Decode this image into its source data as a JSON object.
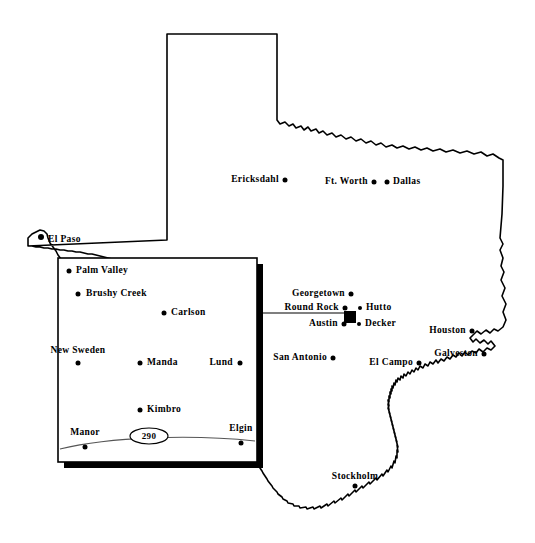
{
  "map": {
    "title": "Texas Swedish Settlements Map",
    "region": "Texas",
    "background_color": "#ffffff",
    "ink_color": "#000000",
    "state_outline_name": "texas-state-outline"
  },
  "cities": [
    {
      "name": "El Paso",
      "x": 41,
      "y": 237,
      "label_x": 48,
      "label_y": 240,
      "anchor": "right",
      "marker": "dot",
      "marker_size": 6
    },
    {
      "name": "Ericksdahl",
      "x": 285,
      "y": 180,
      "label_x": 279,
      "label_y": 180,
      "anchor": "left",
      "marker": "dot",
      "marker_size": 5
    },
    {
      "name": "Ft. Worth",
      "x": 374,
      "y": 182,
      "label_x": 368,
      "label_y": 182,
      "anchor": "left",
      "marker": "dot",
      "marker_size": 5
    },
    {
      "name": "Dallas",
      "x": 387,
      "y": 182,
      "label_x": 393,
      "label_y": 182,
      "anchor": "right",
      "marker": "dot",
      "marker_size": 5
    },
    {
      "name": "Georgetown",
      "x": 351,
      "y": 294,
      "label_x": 345,
      "label_y": 294,
      "anchor": "left",
      "marker": "dot",
      "marker_size": 5
    },
    {
      "name": "Round Rock",
      "x": 345,
      "y": 308,
      "label_x": 339,
      "label_y": 308,
      "anchor": "left",
      "marker": "dot",
      "marker_size": 5
    },
    {
      "name": "Hutto",
      "x": 360,
      "y": 308,
      "label_x": 366,
      "label_y": 308,
      "anchor": "right",
      "marker": "dot",
      "marker_size": 4
    },
    {
      "name": "Austin",
      "x": 344,
      "y": 324,
      "label_x": 338,
      "label_y": 324,
      "anchor": "left",
      "marker": "dot",
      "marker_size": 5
    },
    {
      "name": "Decker",
      "x": 359,
      "y": 324,
      "label_x": 365,
      "label_y": 324,
      "anchor": "right",
      "marker": "dot",
      "marker_size": 4
    },
    {
      "name": "San Antonio",
      "x": 333,
      "y": 358,
      "label_x": 327,
      "label_y": 358,
      "anchor": "left",
      "marker": "dot",
      "marker_size": 5
    },
    {
      "name": "Houston",
      "x": 472,
      "y": 331,
      "label_x": 466,
      "label_y": 331,
      "anchor": "left",
      "marker": "dot",
      "marker_size": 5
    },
    {
      "name": "Galveston",
      "x": 484,
      "y": 354,
      "label_x": 478,
      "label_y": 354,
      "anchor": "left",
      "marker": "dot",
      "marker_size": 5
    },
    {
      "name": "El Campo",
      "x": 419,
      "y": 363,
      "label_x": 413,
      "label_y": 363,
      "anchor": "left",
      "marker": "dot",
      "marker_size": 5
    },
    {
      "name": "Stockholm",
      "x": 355,
      "y": 486,
      "label_x": 355,
      "label_y": 481,
      "anchor": "above",
      "marker": "dot",
      "marker_size": 5
    }
  ],
  "metro_marker": {
    "name": "Austin metro area inset marker",
    "x": 350,
    "y": 317,
    "width": 12,
    "height": 12
  },
  "inset": {
    "name": "Austin area detail inset",
    "left": 58,
    "top": 258,
    "width": 199,
    "height": 204,
    "border_width": 2,
    "shadow_width": 6,
    "connector": {
      "from_x": 257,
      "from_y": 313,
      "to_x": 344,
      "to_y": 313
    },
    "cities": [
      {
        "name": "Palm Valley",
        "x": 69,
        "y": 271,
        "label_x": 76,
        "label_y": 271,
        "anchor": "right",
        "marker_size": 5
      },
      {
        "name": "Brushy Creek",
        "x": 78,
        "y": 294,
        "label_x": 86,
        "label_y": 294,
        "anchor": "right",
        "marker_size": 5
      },
      {
        "name": "Carlson",
        "x": 164,
        "y": 313,
        "label_x": 171,
        "label_y": 313,
        "anchor": "right",
        "marker_size": 5
      },
      {
        "name": "New Sweden",
        "x": 78,
        "y": 363,
        "label_x": 78,
        "label_y": 355,
        "anchor": "above",
        "marker_size": 5
      },
      {
        "name": "Manda",
        "x": 140,
        "y": 363,
        "label_x": 147,
        "label_y": 363,
        "anchor": "right",
        "marker_size": 5
      },
      {
        "name": "Lund",
        "x": 240,
        "y": 363,
        "label_x": 233,
        "label_y": 363,
        "anchor": "left",
        "marker_size": 5
      },
      {
        "name": "Kimbro",
        "x": 140,
        "y": 410,
        "label_x": 147,
        "label_y": 410,
        "anchor": "right",
        "marker_size": 5
      },
      {
        "name": "Manor",
        "x": 85,
        "y": 447,
        "label_x": 85,
        "label_y": 437,
        "anchor": "above",
        "marker_size": 5
      },
      {
        "name": "Elgin",
        "x": 241,
        "y": 443,
        "label_x": 241,
        "label_y": 433,
        "anchor": "above",
        "marker_size": 5
      }
    ],
    "highway": {
      "name": "US Highway 290",
      "shield_label": "290",
      "shield_x": 149,
      "shield_y": 436,
      "shield_rx": 19,
      "shield_ry": 8
    }
  }
}
